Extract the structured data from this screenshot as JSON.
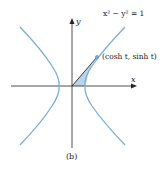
{
  "figure": {
    "caption": "(b)",
    "equation": "x² − y² = 1",
    "point_label": "(cosh t, sinh t)",
    "x_axis_label": "x",
    "y_axis_label": "y",
    "colors": {
      "curve": "#7aaed6",
      "shaded_region": "#b9d4ea",
      "axes": "#222222",
      "radius_line": "#222222",
      "point": "#7aaed6"
    }
  }
}
